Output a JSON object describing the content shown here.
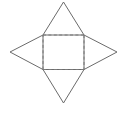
{
  "figure": {
    "name": "square-pyramid-net",
    "background_color": "#ffffff",
    "solid_stroke_color": "#6b6b6b",
    "dashed_stroke_color": "#7a7a7a",
    "solid_stroke_width": 1,
    "dashed_stroke_width": 1,
    "dash_pattern": "3,2.4",
    "fill": "none",
    "canvas": {
      "width": 126,
      "height": 121
    },
    "square": {
      "label": "center-square",
      "top_left": [
        43,
        35
      ],
      "top_right": [
        84,
        35
      ],
      "bottom_right": [
        84,
        69.5
      ],
      "bottom_left": [
        43,
        69.5
      ],
      "style": "dashed"
    },
    "apexes": {
      "top": [
        63.5,
        2
      ],
      "right": [
        117,
        52
      ],
      "bottom": [
        63.5,
        103
      ],
      "left": [
        10,
        52
      ]
    },
    "triangles": [
      {
        "name": "triangle-top",
        "points": "43,35 63.5,2 84,35"
      },
      {
        "name": "triangle-right",
        "points": "84,35 117,52 84,69.5"
      },
      {
        "name": "triangle-bottom",
        "points": "84,69.5 63.5,103 43,69.5"
      },
      {
        "name": "triangle-left",
        "points": "43,69.5 10,52 43,35"
      }
    ],
    "square_edges": [
      {
        "name": "square-edge-top",
        "x1": 43,
        "y1": 35,
        "x2": 84,
        "y2": 35
      },
      {
        "name": "square-edge-right",
        "x1": 84,
        "y1": 35,
        "x2": 84,
        "y2": 69.5
      },
      {
        "name": "square-edge-bottom",
        "x1": 84,
        "y1": 69.5,
        "x2": 43,
        "y2": 69.5
      },
      {
        "name": "square-edge-left",
        "x1": 43,
        "y1": 69.5,
        "x2": 43,
        "y2": 35
      }
    ]
  }
}
